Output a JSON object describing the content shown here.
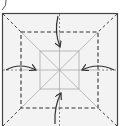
{
  "diagram": {
    "type": "origami-fold-diagram",
    "colors": {
      "background": "#ffffff",
      "paper": "#f2f2f2",
      "outline": "#444444",
      "dashed_fold": "#333333",
      "crease": "#b0b0b0",
      "arrow": "#333333"
    },
    "arrows": [
      {
        "direction": "down",
        "from": "top"
      },
      {
        "direction": "right",
        "from": "left"
      },
      {
        "direction": "left",
        "from": "right"
      },
      {
        "direction": "up",
        "from": "bottom"
      }
    ]
  }
}
